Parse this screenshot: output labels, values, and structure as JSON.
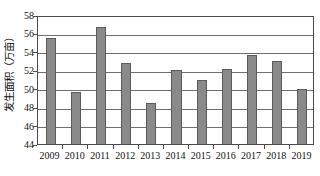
{
  "chart_data": {
    "type": "bar",
    "title": "",
    "subtitle": "",
    "xlabel": "",
    "ylabel": "发生面积（万亩）",
    "categories": [
      "2009",
      "2010",
      "2011",
      "2012",
      "2013",
      "2014",
      "2015",
      "2016",
      "2017",
      "2018",
      "2019"
    ],
    "values": [
      55.5,
      49.6,
      56.7,
      52.8,
      48.4,
      52.0,
      50.9,
      52.15,
      53.7,
      53.05,
      50.0
    ],
    "ylim": [
      44,
      58
    ],
    "yticks": [
      44,
      46,
      48,
      50,
      52,
      54,
      56,
      58
    ],
    "ytick_labels": [
      "44",
      "46",
      "48",
      "50",
      "52",
      "54",
      "56",
      "58"
    ],
    "grid": true,
    "grid_axis": "y",
    "legend": false,
    "legend_position": "none",
    "bar_color": "#8a8a8a",
    "bar_edge_color": "#5a5a5a",
    "axis_color": "#4a4a4a",
    "grid_color": "#6e6e6e",
    "background": "#ffffff",
    "series": [
      {
        "name": "发生面积",
        "values": [
          55.5,
          49.6,
          56.7,
          52.8,
          48.4,
          52.0,
          50.9,
          52.15,
          53.7,
          53.05,
          50.0
        ]
      }
    ]
  }
}
